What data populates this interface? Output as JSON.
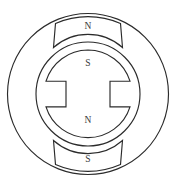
{
  "figure": {
    "kind": "diagram",
    "background_color": "#ffffff",
    "line_color": "#2b2b2b",
    "label_color": "#3a3a3a"
  },
  "labels": {
    "stator_pole_top": "N",
    "stator_pole_bottom": "S",
    "rotor_top": "S",
    "rotor_bottom": "N"
  },
  "geometry": {
    "center_x": 88,
    "center_y": 94,
    "stator_outer_radius": 81,
    "stator_bore_radius": 52,
    "rotor_outer_radius": 44,
    "rotor_slot_half_height": 22,
    "pole_span_half_width": 34,
    "pole_inner_radius": 54,
    "pole_outer_radius": 80
  }
}
